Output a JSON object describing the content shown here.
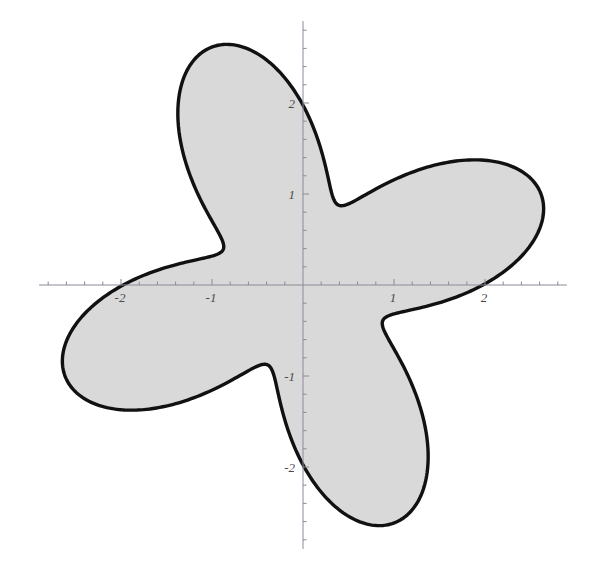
{
  "figure": {
    "title": "",
    "background_color": "#ffffff",
    "width": 599,
    "height": 579
  },
  "axes": {
    "origin_px": {
      "x": 303,
      "y": 285
    },
    "px_per_unit": 91,
    "axis_color": "#8a8a99",
    "axis_line_width": 1,
    "tick_color": "#8a8a99",
    "minor_tick_step": 0.2,
    "major_tick_step": 1,
    "x_axis": {
      "label": "",
      "range": [
        -2.9,
        2.9
      ],
      "tick_values": [
        -2,
        -1,
        1,
        2
      ],
      "tick_labels": [
        "-2",
        "-1",
        "1",
        "2"
      ]
    },
    "y_axis": {
      "label": "",
      "range": [
        -2.9,
        2.9
      ],
      "tick_values": [
        -2,
        -1,
        1,
        2
      ],
      "tick_labels": [
        "-2",
        "-1",
        "1",
        "2"
      ]
    },
    "grid": false,
    "legend": null
  },
  "chart_data": {
    "type": "line",
    "plot_style": "polar-filled-region",
    "title": "",
    "xlabel": "",
    "ylabel": "",
    "xlim": [
      -2.9,
      2.9
    ],
    "ylim": [
      -2.9,
      2.9
    ],
    "grid": false,
    "legend_position": "none",
    "series": [
      {
        "name": "r = 1.88 + 0.92 cos(4(theta - 21 deg))",
        "curve_type": "polar_rose_4_petal",
        "r_mean": 1.88,
        "r_amplitude": 0.92,
        "r_max": 2.8,
        "r_min": 0.96,
        "petal_count": 4,
        "phase_deg": 21,
        "fill_color": "#d9d9d9",
        "stroke_color": "#111111",
        "stroke_width": 3.4,
        "petal_tips_polar": [
          {
            "theta_deg": 21,
            "r": 2.8
          },
          {
            "theta_deg": 111,
            "r": 2.8
          },
          {
            "theta_deg": 201,
            "r": 2.8
          },
          {
            "theta_deg": 291,
            "r": 2.8
          }
        ],
        "petal_tips_cartesian": [
          {
            "x": 2.61,
            "y": 1.0
          },
          {
            "x": -1.0,
            "y": 2.61
          },
          {
            "x": -2.61,
            "y": -1.0
          },
          {
            "x": 1.0,
            "y": -2.61
          }
        ],
        "notches_polar": [
          {
            "theta_deg": 66,
            "r": 0.96
          },
          {
            "theta_deg": 156,
            "r": 0.96
          },
          {
            "theta_deg": 246,
            "r": 0.96
          },
          {
            "theta_deg": 336,
            "r": 0.96
          }
        ],
        "notches_cartesian": [
          {
            "x": 0.39,
            "y": 0.88
          },
          {
            "x": -0.88,
            "y": 0.39
          },
          {
            "x": -0.39,
            "y": -0.88
          },
          {
            "x": 0.88,
            "y": -0.39
          }
        ],
        "sample_points_polar": [
          {
            "theta_deg": 0,
            "r": 2.54
          },
          {
            "theta_deg": 10,
            "r": 2.72
          },
          {
            "theta_deg": 21,
            "r": 2.8
          },
          {
            "theta_deg": 30,
            "r": 2.71
          },
          {
            "theta_deg": 45,
            "r": 2.28
          },
          {
            "theta_deg": 60,
            "r": 1.49
          },
          {
            "theta_deg": 66,
            "r": 1.1
          },
          {
            "theta_deg": 75,
            "r": 0.99
          },
          {
            "theta_deg": 90,
            "r": 1.52
          },
          {
            "theta_deg": 105,
            "r": 2.53
          },
          {
            "theta_deg": 111,
            "r": 2.8
          },
          {
            "theta_deg": 120,
            "r": 2.72
          },
          {
            "theta_deg": 135,
            "r": 2.05
          },
          {
            "theta_deg": 150,
            "r": 1.18
          },
          {
            "theta_deg": 156,
            "r": 0.99
          },
          {
            "theta_deg": 165,
            "r": 1.11
          },
          {
            "theta_deg": 180,
            "r": 2.18
          },
          {
            "theta_deg": 195,
            "r": 2.78
          },
          {
            "theta_deg": 201,
            "r": 2.8
          },
          {
            "theta_deg": 210,
            "r": 2.6
          },
          {
            "theta_deg": 225,
            "r": 1.84
          },
          {
            "theta_deg": 240,
            "r": 1.05
          },
          {
            "theta_deg": 246,
            "r": 0.96
          },
          {
            "theta_deg": 255,
            "r": 1.25
          },
          {
            "theta_deg": 270,
            "r": 2.3
          },
          {
            "theta_deg": 285,
            "r": 2.78
          },
          {
            "theta_deg": 291,
            "r": 2.8
          },
          {
            "theta_deg": 300,
            "r": 2.63
          },
          {
            "theta_deg": 315,
            "r": 1.9
          },
          {
            "theta_deg": 330,
            "r": 1.06
          },
          {
            "theta_deg": 336,
            "r": 0.96
          },
          {
            "theta_deg": 345,
            "r": 1.22
          },
          {
            "theta_deg": 360,
            "r": 2.54
          }
        ]
      }
    ]
  }
}
